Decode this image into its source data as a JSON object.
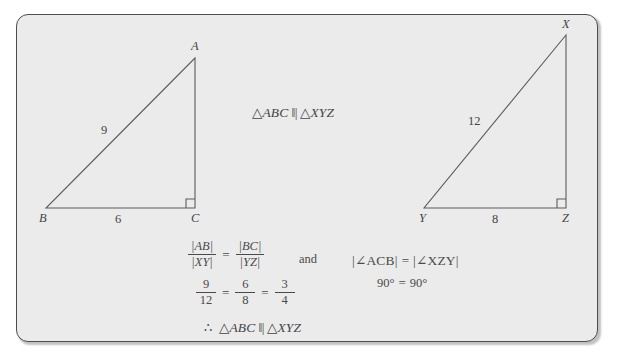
{
  "figure": {
    "caption_center": {
      "triangle_symbol": "△",
      "left_name": "ABC",
      "similar_symbol": "‖|",
      "right_name": "XYZ"
    },
    "panel": {
      "fill_color": "#ebebeb",
      "border_color": "#4d4d4d",
      "page_background": "#ffffff",
      "ink_color": "#454545"
    }
  },
  "triangle_left": {
    "name": "ABC",
    "vertices": [
      {
        "label": "A",
        "x": 195,
        "y": 58
      },
      {
        "label": "B",
        "x": 46,
        "y": 208
      },
      {
        "label": "C",
        "x": 195,
        "y": 208
      }
    ],
    "side_labels": [
      {
        "label": "9",
        "side": "AB",
        "x": 106,
        "y": 128
      },
      {
        "label": "6",
        "side": "BC",
        "x": 118,
        "y": 217
      }
    ],
    "right_angle_at": "C"
  },
  "triangle_right": {
    "name": "XYZ",
    "vertices": [
      {
        "label": "X",
        "x": 566,
        "y": 35
      },
      {
        "label": "Y",
        "x": 424,
        "y": 208
      },
      {
        "label": "Z",
        "x": 566,
        "y": 208
      }
    ],
    "side_labels": [
      {
        "label": "12",
        "side": "XY",
        "x": 474,
        "y": 119
      },
      {
        "label": "8",
        "side": "YZ",
        "x": 495,
        "y": 217
      }
    ],
    "right_angle_at": "Z"
  },
  "proof": {
    "ratio_statement": {
      "left_fraction": {
        "numerator": "|AB|",
        "denominator": "|XY|"
      },
      "equals": "=",
      "right_fraction": {
        "numerator": "|BC|",
        "denominator": "|YZ|"
      }
    },
    "conjunction": "and",
    "angle_statement": {
      "left": "|∠ACB|",
      "equals": "=",
      "right": "|∠XZY|"
    },
    "numeric_ratio": {
      "f1": {
        "numerator": "9",
        "denominator": "12"
      },
      "eq1": "=",
      "f2": {
        "numerator": "6",
        "denominator": "8"
      },
      "eq2": "=",
      "f3": {
        "numerator": "3",
        "denominator": "4"
      }
    },
    "angle_values": {
      "left": "90°",
      "equals": "=",
      "right": "90°"
    },
    "conclusion": {
      "therefore": "∴",
      "triangle_symbol": "△",
      "left_name": "ABC",
      "similar_symbol": "‖|",
      "right_name": "XYZ"
    }
  }
}
